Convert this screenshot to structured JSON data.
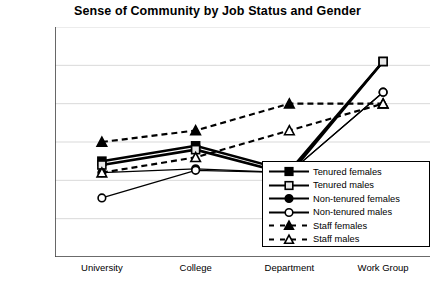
{
  "chart_data": {
    "type": "line",
    "title": "Sense of Community by Job Status and Gender",
    "xlabel": "",
    "ylabel": "",
    "categories": [
      "University",
      "College",
      "Department",
      "Work Group"
    ],
    "ylim": [
      2,
      5
    ],
    "ytick_values": [
      2,
      2.5,
      3,
      3.5,
      4,
      4.5,
      5
    ],
    "ytick_labels": [
      "2",
      "2.5",
      "3",
      "3.5",
      "4",
      "4.5",
      "5"
    ],
    "grid": true,
    "legend_position": "inside-bottom-right",
    "series": [
      {
        "name": "Tenured females",
        "marker": "filled-square",
        "line": "solid",
        "values": [
          3.25,
          3.45,
          3.12,
          4.55
        ]
      },
      {
        "name": "Tenured males",
        "marker": "open-square",
        "line": "solid",
        "values": [
          3.2,
          3.4,
          3.08,
          4.55
        ]
      },
      {
        "name": "Non-tenured females",
        "marker": "filled-circle",
        "line": "solid",
        "values": [
          3.1,
          3.15,
          3.1,
          4.15
        ]
      },
      {
        "name": "Non-tenured males",
        "marker": "open-circle",
        "line": "solid",
        "values": [
          2.77,
          3.13,
          3.1,
          4.15
        ]
      },
      {
        "name": "Staff females",
        "marker": "filled-triangle",
        "line": "dashed",
        "values": [
          3.5,
          3.65,
          4.0,
          4.0
        ]
      },
      {
        "name": "Staff males",
        "marker": "open-triangle",
        "line": "dashed",
        "values": [
          3.1,
          3.3,
          3.65,
          4.0
        ]
      }
    ]
  },
  "colors": {
    "line": "#000000",
    "grid": "#d9d9d9",
    "axis": "#404040",
    "background": "#ffffff"
  }
}
